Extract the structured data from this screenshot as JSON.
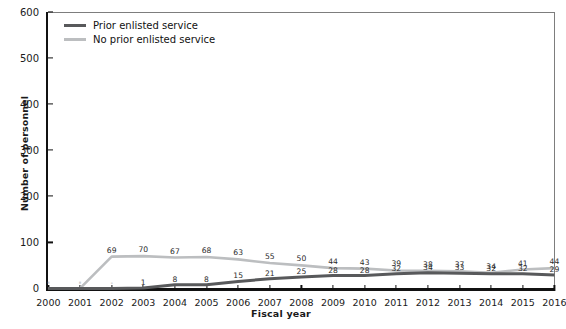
{
  "chart_data": {
    "type": "line",
    "title": "",
    "xlabel": "Fiscal year",
    "ylabel": "Number of personnel",
    "categories": [
      2000,
      2001,
      2002,
      2003,
      2004,
      2005,
      2006,
      2007,
      2008,
      2009,
      2010,
      2011,
      2012,
      2013,
      2014,
      2015,
      2016
    ],
    "x_tick_labels": [
      "2000",
      "2001",
      "2002",
      "2003",
      "2004",
      "2005",
      "2006",
      "2007",
      "2008",
      "2009",
      "2010",
      "2011",
      "2012",
      "2013",
      "2014",
      "2015",
      "2016"
    ],
    "y_tick_labels": [
      "0",
      "100",
      "200",
      "300",
      "400",
      "500",
      "600"
    ],
    "y_ticks": [
      0,
      100,
      200,
      300,
      400,
      500,
      600
    ],
    "ylim": [
      0,
      600
    ],
    "xlim": [
      2000,
      2016
    ],
    "grid": false,
    "legend_position": "top-left",
    "series": [
      {
        "name": "Prior enlisted service",
        "color": "#58595b",
        "values": [
          0,
          0,
          0,
          1,
          8,
          8,
          15,
          21,
          25,
          28,
          28,
          32,
          34,
          33,
          32,
          32,
          29
        ],
        "point_labels": [
          "-",
          "-",
          "-",
          "1",
          "8",
          "8",
          "15",
          "21",
          "25",
          "28",
          "28",
          "32",
          "34",
          "33",
          "32",
          "32",
          "29"
        ]
      },
      {
        "name": "No prior enlisted service",
        "color": "#bcbec0",
        "values": [
          0,
          0,
          69,
          70,
          67,
          68,
          63,
          55,
          50,
          44,
          43,
          39,
          38,
          37,
          34,
          41,
          44
        ],
        "point_labels": [
          "-",
          "-",
          "69",
          "70",
          "67",
          "68",
          "63",
          "55",
          "50",
          "44",
          "43",
          "39",
          "38",
          "37",
          "34",
          "41",
          "44"
        ]
      }
    ]
  },
  "legend": {
    "items": [
      {
        "label": "Prior enlisted service",
        "color": "#58595b"
      },
      {
        "label": "No prior enlisted service",
        "color": "#bcbec0"
      }
    ]
  },
  "axes": {
    "y_title": "Number of personnel",
    "x_title": "Fiscal year"
  }
}
